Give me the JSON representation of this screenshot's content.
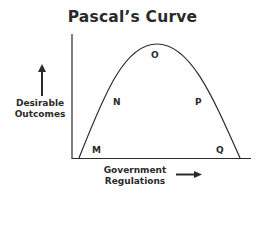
{
  "title": "Pascal’s Curve",
  "y_label": [
    "Desirable",
    "Outcomes"
  ],
  "x_label": [
    "Government",
    "Regulations"
  ],
  "points": [
    {
      "name": "M",
      "x": 92,
      "y": 145
    },
    {
      "name": "N",
      "x": 115,
      "y": 97
    },
    {
      "name": "O",
      "x": 151,
      "y": 50
    },
    {
      "name": "P",
      "x": 195,
      "y": 97
    },
    {
      "name": "Q",
      "x": 216,
      "y": 145
    }
  ],
  "colors": {
    "line": "#2a2a2a",
    "text": "#2a2a2a",
    "background": "#ffffff"
  }
}
